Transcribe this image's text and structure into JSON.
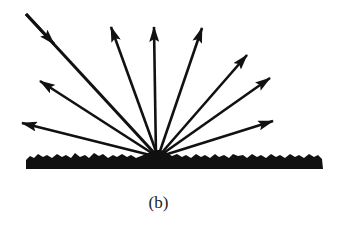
{
  "figure": {
    "caption": "(b)",
    "colors": {
      "ink": "#111111",
      "background": "#ffffff"
    },
    "origin": {
      "x": 158,
      "y": 157
    },
    "surface": {
      "x1": 25,
      "x2": 323,
      "top": 153,
      "bottom": 170
    },
    "incident_ray": {
      "from": [
        26,
        14
      ],
      "to": [
        158,
        157
      ],
      "head_at": [
        54,
        44
      ]
    },
    "reflected_rays": [
      {
        "name": "left-low",
        "tip": [
          22,
          123
        ]
      },
      {
        "name": "left-mid",
        "tip": [
          40,
          81
        ]
      },
      {
        "name": "up-left",
        "tip": [
          111,
          27
        ]
      },
      {
        "name": "vertical",
        "tip": [
          154,
          27
        ]
      },
      {
        "name": "up-right",
        "tip": [
          202,
          28
        ]
      },
      {
        "name": "right-upper",
        "tip": [
          247,
          55
        ]
      },
      {
        "name": "right-mid",
        "tip": [
          270,
          78
        ]
      },
      {
        "name": "right-low",
        "tip": [
          273,
          121
        ]
      }
    ]
  }
}
